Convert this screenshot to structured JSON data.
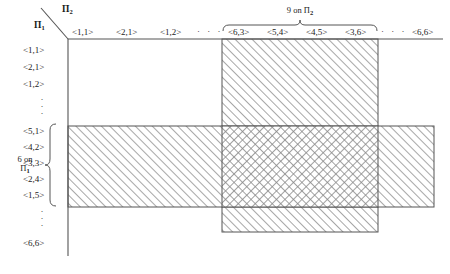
{
  "axes": {
    "vertical_name": "Π",
    "vertical_sub": "1",
    "horizontal_name": "Π",
    "horizontal_sub": "2"
  },
  "columns": {
    "labels_left": [
      "<1,1>",
      "<2,1>",
      "<1,2>"
    ],
    "ellipsis_left": "·  ·  ·",
    "labels_group": [
      "<6,3>",
      "<5,4>",
      "<4,5>",
      "<3,6>"
    ],
    "ellipsis_right": "·  ·  ·",
    "label_last": "<6,6>",
    "group_caption_line1": "9 on Π",
    "group_caption_sub": "2"
  },
  "rows": {
    "labels_top": [
      "<1,1>",
      "<2,1>",
      "<1,2>"
    ],
    "ellipsis_top": "·",
    "labels_group": [
      "<5,1>",
      "<4,2>",
      "<3,3>",
      "<2,4>",
      "<1,5>"
    ],
    "ellipsis_bottom": "·",
    "label_last": "<6,6>",
    "group_caption_line1": "6 on",
    "group_caption_line2": "Π",
    "group_caption_sub": "1"
  },
  "colors": {
    "line": "#555555",
    "hatch": "#8a8a8a",
    "text": "#242424",
    "background": "#ffffff"
  },
  "regions": {
    "vertical_band_label": "9-on-Pi2-column-band",
    "horizontal_band_label": "6-on-Pi1-row-band",
    "intersection_label": "cross-hatched-intersection"
  }
}
